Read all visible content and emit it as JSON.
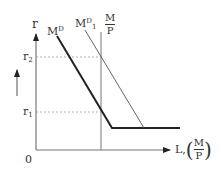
{
  "diagram": {
    "type": "economics-supply-demand",
    "axes": {
      "y_label": "r",
      "x_label_prefix": "L,",
      "x_label_fraction": {
        "num": "M",
        "den": "P"
      },
      "origin_label": "0"
    },
    "y_levels": [
      {
        "label": "r",
        "sub": "2",
        "description": "higher interest rate"
      },
      {
        "label": "r",
        "sub": "1",
        "description": "lower interest rate"
      }
    ],
    "curves": [
      {
        "name": "M",
        "sup": "D",
        "sub": "",
        "style": "bold",
        "description": "original money demand"
      },
      {
        "name": "M",
        "sup": "D",
        "sub": "1",
        "style": "thin",
        "description": "shifted money demand"
      }
    ],
    "supply_label": {
      "num": "M",
      "den": "P"
    },
    "indicator_arrow": "up"
  }
}
